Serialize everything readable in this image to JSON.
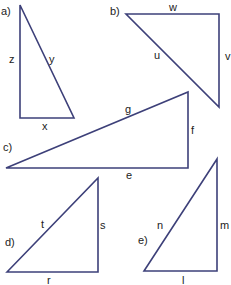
{
  "colors": {
    "line": "#3d4079",
    "text": "#222222",
    "background": "#ffffff"
  },
  "triangles": [
    {
      "id": "a",
      "label": "a)",
      "points": "20,5 20,118 74,118",
      "label_pos": [
        1,
        15
      ],
      "sides": [
        {
          "name": "z",
          "x": 9,
          "y": 63
        },
        {
          "name": "y",
          "x": 49,
          "y": 63
        },
        {
          "name": "x",
          "x": 42,
          "y": 130
        }
      ]
    },
    {
      "id": "b",
      "label": "b)",
      "points": "126,14 219,14 219,107",
      "label_pos": [
        110,
        15
      ],
      "sides": [
        {
          "name": "w",
          "x": 169,
          "y": 11
        },
        {
          "name": "v",
          "x": 225,
          "y": 60
        },
        {
          "name": "u",
          "x": 154,
          "y": 59
        }
      ]
    },
    {
      "id": "c",
      "label": "c)",
      "points": "6,168 188,92 188,168",
      "label_pos": [
        3,
        151
      ],
      "sides": [
        {
          "name": "g",
          "x": 125,
          "y": 113
        },
        {
          "name": "f",
          "x": 191,
          "y": 134
        },
        {
          "name": "e",
          "x": 126,
          "y": 179
        }
      ]
    },
    {
      "id": "d",
      "label": "d)",
      "points": "7,272 98,178 98,272",
      "label_pos": [
        5,
        246
      ],
      "sides": [
        {
          "name": "t",
          "x": 41,
          "y": 228
        },
        {
          "name": "s",
          "x": 100,
          "y": 229
        },
        {
          "name": "r",
          "x": 47,
          "y": 284
        }
      ]
    },
    {
      "id": "e",
      "label": "e)",
      "points": "144,271 217,159 217,271",
      "label_pos": [
        138,
        244
      ],
      "sides": [
        {
          "name": "n",
          "x": 157,
          "y": 229
        },
        {
          "name": "m",
          "x": 220,
          "y": 229
        },
        {
          "name": "l",
          "x": 182,
          "y": 284
        }
      ]
    }
  ]
}
